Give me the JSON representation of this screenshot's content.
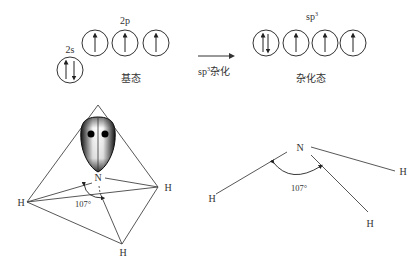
{
  "orbital_diagram": {
    "ground_state": {
      "label": "基态",
      "s_orbital_label": "2s",
      "p_orbital_label": "2p",
      "s_orbital": [
        "up-down"
      ],
      "p_orbitals": [
        "up",
        "up",
        "up"
      ]
    },
    "transition": {
      "label_prefix": "sp",
      "label_superscript": "3",
      "label_suffix": "杂化"
    },
    "hybrid_state": {
      "label": "杂化态",
      "orbital_label_prefix": "sp",
      "orbital_label_superscript": "3",
      "orbitals": [
        "up-down",
        "up",
        "up",
        "up"
      ]
    }
  },
  "tetrahedral_model": {
    "central_atom": "N",
    "vertices": [
      "H",
      "H",
      "H"
    ],
    "angle_label": "107°",
    "lone_pair": "lone-pair-lobe"
  },
  "pyramidal_model": {
    "central_atom": "N",
    "vertices": [
      "H",
      "H",
      "H"
    ],
    "angle_label": "107°"
  }
}
